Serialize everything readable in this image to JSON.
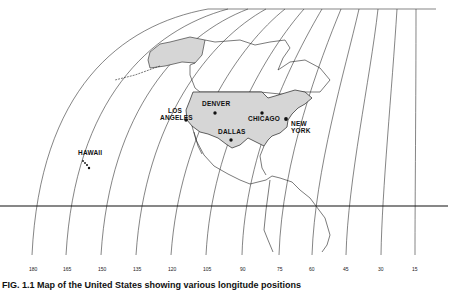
{
  "figure": {
    "caption": "FIG. 1.1  Map of the United States showing various longitude positions",
    "colors": {
      "ink": "#111111",
      "shade": "#d6d6d6",
      "paper": "#ffffff"
    }
  },
  "cities": [
    {
      "name": "DENVER",
      "x": 225,
      "y": 113,
      "label_x": 203,
      "label_y": 106
    },
    {
      "name": "CHICAGO",
      "x": 261,
      "y": 113,
      "label_x": 247,
      "label_y": 121
    },
    {
      "name": "DALLAS",
      "x": 230,
      "y": 139,
      "label_x": 218,
      "label_y": 133
    },
    {
      "name": "NEW",
      "x": 285,
      "y": 119,
      "label_x": 291,
      "label_y": 126
    },
    {
      "name": "YORK",
      "x": 285,
      "y": 119,
      "label_x": 291,
      "label_y": 133
    },
    {
      "name": "LOS",
      "x": 186,
      "y": 120,
      "label_x": 166,
      "label_y": 113
    },
    {
      "name": "ANGELES",
      "x": 186,
      "y": 120,
      "label_x": 160,
      "label_y": 120
    }
  ],
  "hawaii": {
    "name": "HAWAII",
    "label_x": 78,
    "label_y": 155
  },
  "longitudes": {
    "labels": [
      "180",
      "165",
      "150",
      "135",
      "120",
      "105",
      "90",
      "75",
      "60",
      "45",
      "30",
      "15"
    ],
    "x_positions": [
      32,
      66,
      101,
      136,
      171,
      206,
      242,
      279,
      312,
      346,
      381,
      415
    ]
  },
  "equator": {
    "y": 206
  }
}
